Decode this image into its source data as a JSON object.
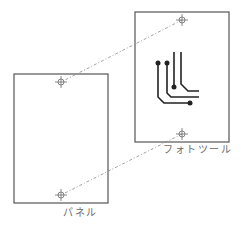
{
  "diagram": {
    "type": "registration-alignment",
    "colors": {
      "background": "#ffffff",
      "frame": "#555555",
      "dashed_line": "#8a8a8a",
      "crosshair": "#6a6a6a",
      "trace": "#222222",
      "label": "#6a6a6a"
    },
    "panel": {
      "label": "パネル",
      "rect": {
        "x": 14,
        "y": 74,
        "w": 94,
        "h": 129
      },
      "markers": [
        {
          "x": 61,
          "y": 82
        },
        {
          "x": 61,
          "y": 195
        }
      ]
    },
    "phototool": {
      "label": "フォトツール",
      "rect": {
        "x": 135,
        "y": 12,
        "w": 94,
        "h": 130
      },
      "markers": [
        {
          "x": 182,
          "y": 20
        },
        {
          "x": 182,
          "y": 134
        }
      ]
    },
    "connectors": [
      {
        "from": {
          "x": 182,
          "y": 20
        },
        "to": {
          "x": 61,
          "y": 82
        }
      },
      {
        "from": {
          "x": 182,
          "y": 134
        },
        "to": {
          "x": 61,
          "y": 195
        }
      }
    ],
    "traces": [
      {
        "points": "158,63 158,97 164,103 190,103",
        "pads": [
          {
            "x": 158,
            "y": 63
          },
          {
            "x": 190,
            "y": 103
          }
        ]
      },
      {
        "points": "167,63 167,93 171,97 199,97",
        "pads": [
          {
            "x": 167,
            "y": 63
          }
        ]
      },
      {
        "points": "174,52 174,87",
        "pads": [
          {
            "x": 174,
            "y": 87
          }
        ]
      },
      {
        "points": "181,52 181,84 188,91 199,91",
        "pads": []
      }
    ]
  }
}
